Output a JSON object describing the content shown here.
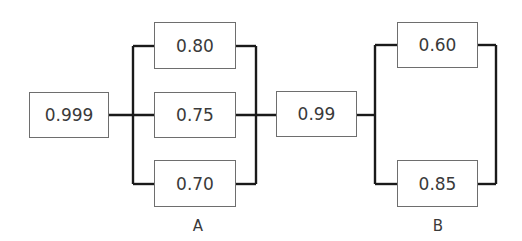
{
  "diagram": {
    "type": "reliability-block-diagram",
    "components": [
      {
        "id": "c1",
        "value": "0.999",
        "x": 29,
        "y": 92,
        "w": 80,
        "h": 46
      },
      {
        "id": "a1",
        "value": "0.80",
        "x": 154,
        "y": 22,
        "w": 82,
        "h": 47
      },
      {
        "id": "a2",
        "value": "0.75",
        "x": 154,
        "y": 92,
        "w": 82,
        "h": 46
      },
      {
        "id": "a3",
        "value": "0.70",
        "x": 154,
        "y": 160,
        "w": 82,
        "h": 47
      },
      {
        "id": "c2",
        "value": "0.99",
        "x": 276,
        "y": 91,
        "w": 81,
        "h": 46
      },
      {
        "id": "b1",
        "value": "0.60",
        "x": 397,
        "y": 22,
        "w": 81,
        "h": 46
      },
      {
        "id": "b2",
        "value": "0.85",
        "x": 397,
        "y": 160,
        "w": 81,
        "h": 47
      }
    ],
    "groups": [
      {
        "id": "A",
        "label": "A",
        "members": [
          "0.80",
          "0.75",
          "0.70"
        ],
        "arrangement": "parallel"
      },
      {
        "id": "B",
        "label": "B",
        "members": [
          "0.60",
          "0.85"
        ],
        "arrangement": "parallel"
      }
    ],
    "series_order": [
      "0.999",
      "A",
      "0.99",
      "B"
    ],
    "colors": {
      "line": "#1a1a1a",
      "box_border": "#6e6e6e",
      "text": "#3a3a3a"
    }
  }
}
